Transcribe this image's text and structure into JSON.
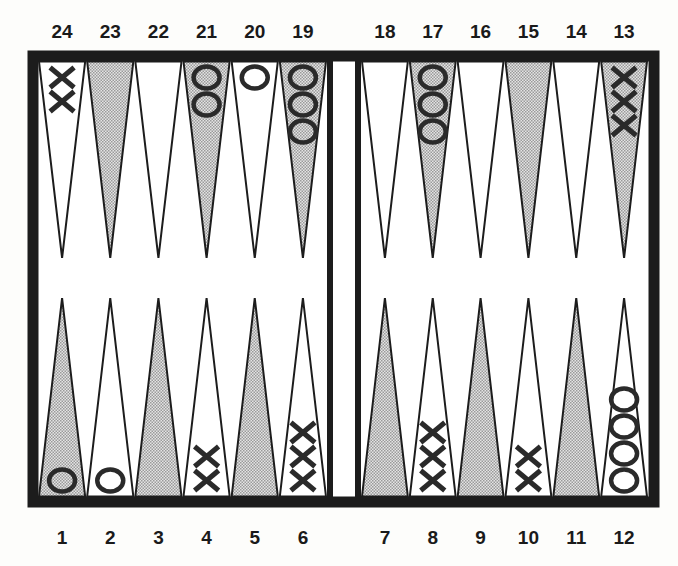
{
  "board": {
    "colors": {
      "frame": "#1c1c1c",
      "background": "#fdfdfb",
      "point_light": "#ffffff",
      "point_shaded": "#c9c9c9",
      "piece": "#2a2a2a"
    },
    "top_labels": [
      "24",
      "23",
      "22",
      "21",
      "20",
      "19",
      "18",
      "17",
      "16",
      "15",
      "14",
      "13"
    ],
    "bottom_labels": [
      "1",
      "2",
      "3",
      "4",
      "5",
      "6",
      "7",
      "8",
      "9",
      "10",
      "11",
      "12"
    ],
    "points": [
      {
        "number": 1,
        "row": "bottom",
        "shaded": true,
        "piece": "O",
        "count": 1
      },
      {
        "number": 2,
        "row": "bottom",
        "shaded": false,
        "piece": "O",
        "count": 1
      },
      {
        "number": 3,
        "row": "bottom",
        "shaded": true,
        "piece": "",
        "count": 0
      },
      {
        "number": 4,
        "row": "bottom",
        "shaded": false,
        "piece": "X",
        "count": 2
      },
      {
        "number": 5,
        "row": "bottom",
        "shaded": true,
        "piece": "",
        "count": 0
      },
      {
        "number": 6,
        "row": "bottom",
        "shaded": false,
        "piece": "X",
        "count": 3
      },
      {
        "number": 7,
        "row": "bottom",
        "shaded": true,
        "piece": "",
        "count": 0
      },
      {
        "number": 8,
        "row": "bottom",
        "shaded": false,
        "piece": "X",
        "count": 3
      },
      {
        "number": 9,
        "row": "bottom",
        "shaded": true,
        "piece": "",
        "count": 0
      },
      {
        "number": 10,
        "row": "bottom",
        "shaded": false,
        "piece": "X",
        "count": 2
      },
      {
        "number": 11,
        "row": "bottom",
        "shaded": true,
        "piece": "",
        "count": 0
      },
      {
        "number": 12,
        "row": "bottom",
        "shaded": false,
        "piece": "O",
        "count": 4
      },
      {
        "number": 13,
        "row": "top",
        "shaded": true,
        "piece": "X",
        "count": 3
      },
      {
        "number": 14,
        "row": "top",
        "shaded": false,
        "piece": "",
        "count": 0
      },
      {
        "number": 15,
        "row": "top",
        "shaded": true,
        "piece": "",
        "count": 0
      },
      {
        "number": 16,
        "row": "top",
        "shaded": false,
        "piece": "",
        "count": 0
      },
      {
        "number": 17,
        "row": "top",
        "shaded": true,
        "piece": "O",
        "count": 3
      },
      {
        "number": 18,
        "row": "top",
        "shaded": false,
        "piece": "",
        "count": 0
      },
      {
        "number": 19,
        "row": "top",
        "shaded": true,
        "piece": "O",
        "count": 3
      },
      {
        "number": 20,
        "row": "top",
        "shaded": false,
        "piece": "O",
        "count": 1
      },
      {
        "number": 21,
        "row": "top",
        "shaded": true,
        "piece": "O",
        "count": 2
      },
      {
        "number": 22,
        "row": "top",
        "shaded": false,
        "piece": "",
        "count": 0
      },
      {
        "number": 23,
        "row": "top",
        "shaded": true,
        "piece": "",
        "count": 0
      },
      {
        "number": 24,
        "row": "top",
        "shaded": false,
        "piece": "X",
        "count": 2
      }
    ]
  }
}
